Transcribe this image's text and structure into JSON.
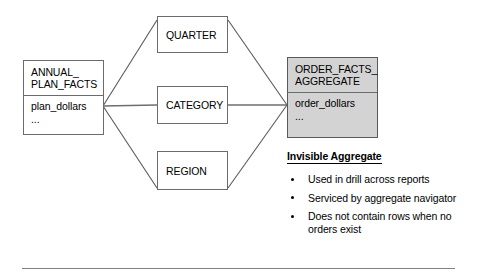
{
  "diagram": {
    "source_entity": {
      "title": "ANNUAL_\nPLAN_FACTS",
      "body": "plan_dollars\n..."
    },
    "dimensions": [
      {
        "label": "QUARTER"
      },
      {
        "label": "CATEGORY"
      },
      {
        "label": "REGION"
      }
    ],
    "target_entity": {
      "title": "ORDER_FACTS_\nAGGREGATE",
      "body": "order_dollars\n...",
      "fill_color": "#d3d3d3"
    },
    "annotation": {
      "heading": "Invisible Aggregate",
      "bullets": [
        "Used in drill across reports",
        "Serviced by aggregate navigator",
        "Does not contain rows when no orders exist"
      ]
    },
    "line_color": "#58595b",
    "border_color": "#6a6b6d"
  }
}
